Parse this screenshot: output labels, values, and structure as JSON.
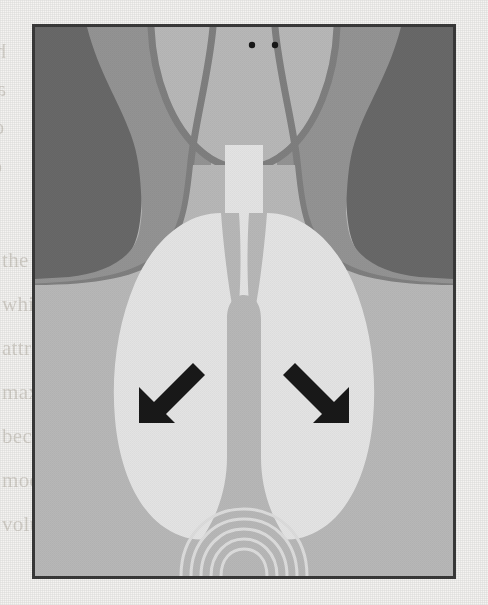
{
  "figure": {
    "caption_alt": "Postero-anterior chest radiograph diagram showing hyperinflated lungs with flattened diaphragms indicated by two arrows",
    "border_color": "#3a3a3a",
    "frame": {
      "x": 32,
      "y": 24,
      "width": 424,
      "height": 555
    }
  },
  "palette": {
    "paper": "#f5f4f2",
    "background_dark_gray": "#717171",
    "soft_tissue_gray": "#a0a0a0",
    "chest_light_gray": "#c8c8c8",
    "outline_gray": "#8a8a8a",
    "lung_field": "#f8f8f8",
    "marker_black": "#1a1a1a",
    "bleed_text": "#cfcbc4"
  },
  "anatomy": {
    "regions": [
      {
        "name": "background-corner-left",
        "label": "Background (dark)",
        "color": "#717171"
      },
      {
        "name": "background-corner-right",
        "label": "Background (dark)",
        "color": "#717171"
      },
      {
        "name": "shoulder-left",
        "label": "Left shoulder soft tissue",
        "color": "#a0a0a0"
      },
      {
        "name": "shoulder-right",
        "label": "Right shoulder soft tissue",
        "color": "#a0a0a0"
      },
      {
        "name": "neck-head",
        "label": "Neck and lower head",
        "color": "#c8c8c8"
      },
      {
        "name": "thorax",
        "label": "Thorax soft tissue",
        "color": "#c8c8c8"
      },
      {
        "name": "trachea",
        "label": "Trachea (air column)",
        "color": "#f8f8f8"
      },
      {
        "name": "lung-field-left",
        "label": "Left lung field",
        "color": "#f8f8f8"
      },
      {
        "name": "lung-field-right",
        "label": "Right lung field",
        "color": "#f8f8f8"
      },
      {
        "name": "mediastinum",
        "label": "Mediastinum / cardiac silhouette",
        "color": "#c8c8c8"
      },
      {
        "name": "diaphragm",
        "label": "Flattened diaphragms",
        "color": "#c8c8c8"
      },
      {
        "name": "gastric-bubble",
        "label": "Gastric bubble arcs",
        "color": "#f0f0f0"
      }
    ],
    "dots": [
      {
        "name": "marker-dot-left",
        "cx": 249,
        "cy": 42,
        "r": 3.2
      },
      {
        "name": "marker-dot-right",
        "cx": 272,
        "cy": 42,
        "r": 3.2
      }
    ],
    "arrows": [
      {
        "name": "arrow-left-diaphragm",
        "label": "Arrow pointing to flattened right hemidiaphragm",
        "direction": "down-left",
        "tail_x": 196,
        "tail_y": 378,
        "tip_x": 156,
        "tip_y": 418
      },
      {
        "name": "arrow-right-diaphragm",
        "label": "Arrow pointing to flattened left hemidiaphragm",
        "direction": "down-right",
        "tail_x": 310,
        "tail_y": 378,
        "tip_x": 350,
        "tip_y": 418
      }
    ]
  },
  "bleed_text": {
    "note": "faint mirrored show-through text from the reverse page",
    "lines": [
      {
        "name": "bleed-line-1",
        "text": "hyperinflated",
        "x": 6,
        "y": 40,
        "size": 20,
        "flip": true
      },
      {
        "name": "bleed-line-2",
        "text": "and the",
        "x": 6,
        "y": 78,
        "size": 20,
        "flip": true
      },
      {
        "name": "bleed-line-3",
        "text": "diaphragms",
        "x": 4,
        "y": 116,
        "size": 20,
        "flip": true
      },
      {
        "name": "bleed-line-4",
        "text": "chest was",
        "x": 2,
        "y": 155,
        "size": 20,
        "flip": true
      },
      {
        "name": "bleed-line-5",
        "text": "the lungs were hyperinflated and",
        "x": 2,
        "y": 248,
        "size": 21,
        "flip": false
      },
      {
        "name": "bleed-line-6",
        "text": "while the aortic arch was",
        "x": 2,
        "y": 292,
        "size": 21,
        "flip": false
      },
      {
        "name": "bleed-line-7",
        "text": "attributed to the flattening of",
        "x": 2,
        "y": 336,
        "size": 21,
        "flip": false
      },
      {
        "name": "bleed-line-8",
        "text": "maximally expanded, the diaphr",
        "x": 2,
        "y": 380,
        "size": 21,
        "flip": false
      },
      {
        "name": "bleed-line-9",
        "text": "become small because intrinsic",
        "x": 2,
        "y": 424,
        "size": 21,
        "flip": false
      },
      {
        "name": "bleed-line-10",
        "text": "modify the way the brain exerts",
        "x": 2,
        "y": 468,
        "size": 21,
        "flip": false
      },
      {
        "name": "bleed-line-11",
        "text": "volume reduction rehabilitation",
        "x": 2,
        "y": 512,
        "size": 21,
        "flip": false
      }
    ]
  }
}
